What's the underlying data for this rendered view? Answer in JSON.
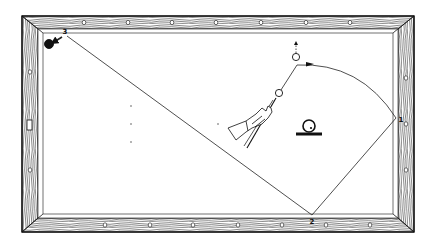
{
  "diagram": {
    "type": "billiards-shot-diagram",
    "colors": {
      "ink": "#111111",
      "frame_fill": "#ffffff",
      "cloth": "#ffffff"
    },
    "table": {
      "outer": {
        "x": 22,
        "y": 16,
        "w": 392,
        "h": 216
      },
      "cushion_inner": {
        "x": 38,
        "y": 30,
        "w": 360,
        "h": 187
      },
      "diamonds_top_x": [
        84,
        128,
        172,
        216,
        261,
        306,
        350
      ],
      "diamonds_bottom_x": [
        105,
        150,
        193,
        238,
        282,
        326,
        370
      ],
      "diamonds_left_y": [
        72,
        124,
        170
      ],
      "diamonds_right_y": [
        78,
        124,
        170
      ]
    },
    "cushion_labels": [
      {
        "id": "1",
        "text": "1",
        "x": 401,
        "y": 122
      },
      {
        "id": "2",
        "text": "2",
        "x": 312,
        "y": 224
      },
      {
        "id": "3",
        "text": "3",
        "x": 65,
        "y": 34
      }
    ],
    "balls": {
      "cue_ball": {
        "cx": 279,
        "cy": 93,
        "r": 3.6
      },
      "object_ball": {
        "cx": 296,
        "cy": 57,
        "r": 3.6
      },
      "final_ball": {
        "cx": 49,
        "cy": 44,
        "r": 4.5,
        "filled": true
      }
    },
    "path": {
      "cue_to_contact": [
        [
          279,
          93
        ],
        [
          297,
          65
        ]
      ],
      "curve_start": [
        297,
        65
      ],
      "curve_ctrl": [
        360,
        62
      ],
      "curve_end": [
        396,
        118
      ],
      "rail1_to_rail2": [
        [
          396,
          118
        ],
        [
          312,
          215
        ]
      ],
      "rail2_to_rail3": [
        [
          312,
          215
        ],
        [
          67,
          36
        ]
      ],
      "object_ball_exit": [
        [
          296,
          53
        ],
        [
          296,
          43
        ]
      ]
    },
    "legend_symbol": {
      "name": "ball-on-base",
      "ball": {
        "cx": 309,
        "cy": 126,
        "r": 6
      },
      "base": {
        "x1": 296,
        "x2": 322,
        "y": 134
      }
    },
    "aim_dots": [
      [
        131,
        106
      ],
      [
        131,
        124
      ],
      [
        131,
        142
      ],
      [
        218,
        124
      ]
    ]
  }
}
